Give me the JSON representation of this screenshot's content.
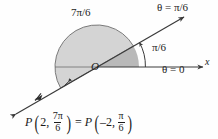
{
  "figure": {
    "colors": {
      "background": "#fefefe",
      "stroke": "#3a3a3a",
      "sector_fill": "#d4d4d4",
      "wedge_fill": "#b9b9b9",
      "text": "#1c1c1c"
    },
    "origin_label": "O",
    "axis_label": "x",
    "sector_angle_label": "7π/6",
    "ray_label": "θ = π/6",
    "angle_label": "π/6",
    "zero_label": "θ = 0",
    "geometry": {
      "origin_x": 97,
      "origin_y": 67,
      "sector_radius": 42,
      "arc_radius": 47,
      "ray_angle_deg": 30,
      "sector_sweep_deg": 210,
      "point_marker_x": 38,
      "point_marker_y": 96
    }
  },
  "equation": {
    "left": {
      "name": "P",
      "r": "2",
      "theta_num": "7π",
      "theta_den": "6"
    },
    "operator": "=",
    "right": {
      "name": "P",
      "r": "–2",
      "theta_num": "π",
      "theta_den": "6"
    }
  }
}
